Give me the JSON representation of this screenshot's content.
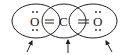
{
  "diagram": {
    "atoms": [
      {
        "symbol": "O",
        "cx": 35,
        "lone_pairs": "top,bottom"
      },
      {
        "symbol": "C",
        "cx": 64,
        "lone_pairs": ""
      },
      {
        "symbol": "O",
        "cx": 99,
        "lone_pairs": "top,bottom"
      }
    ],
    "bonds": [
      {
        "type": "double",
        "from": 0,
        "to": 1
      },
      {
        "type": "double",
        "from": 1,
        "to": 2
      }
    ],
    "ellipses": [
      {
        "cx": 36,
        "cy": 21,
        "rx": 24,
        "ry": 17
      },
      {
        "cx": 64,
        "cy": 21,
        "rx": 22,
        "ry": 17
      },
      {
        "cx": 93,
        "cy": 21,
        "rx": 24,
        "ry": 17
      }
    ],
    "arrows": [
      {
        "x1": 27,
        "y1": 52,
        "x2": 32,
        "y2": 41
      },
      {
        "x1": 68,
        "y1": 53,
        "x2": 68,
        "y2": 40
      },
      {
        "x1": 112,
        "y1": 52,
        "x2": 106,
        "y2": 41
      }
    ],
    "colors": {
      "stroke": "#222222",
      "background": "#ffffff"
    }
  }
}
